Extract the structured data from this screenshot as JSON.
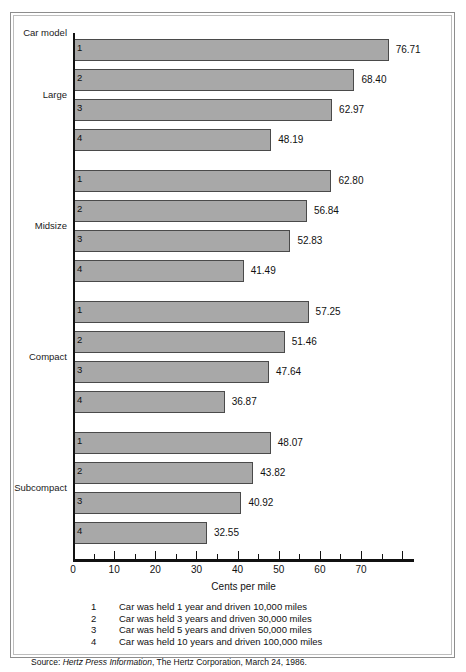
{
  "figure": {
    "header_label": "Car model",
    "axis_title": "Cents per mile",
    "source_prefix": "Source:",
    "source_italic": "Hertz Press Information",
    "source_rest": ", The Hertz Corporation, March 24, 1986.",
    "bar_color": "#a8a8a8",
    "bar_border_color": "#4a4a4a",
    "axis_color": "#111111",
    "frame_color": "#8d8d8d"
  },
  "legend": [
    {
      "key": "1",
      "text": "Car was held 1 year and driven 10,000 miles"
    },
    {
      "key": "2",
      "text": "Car was held 3 years and driven 30,000 miles"
    },
    {
      "key": "3",
      "text": "Car was held 5 years and driven 50,000 miles"
    },
    {
      "key": "4",
      "text": "Car was held 10 years and driven 100,000 miles"
    }
  ],
  "chart_data": {
    "type": "bar",
    "orientation": "horizontal",
    "title": "",
    "xlabel": "Cents per mile",
    "ylabel": "Car model",
    "xlim": [
      0,
      80
    ],
    "xticks": [
      0,
      10,
      20,
      30,
      40,
      50,
      60,
      70
    ],
    "xtick_labels": [
      "0",
      "10",
      "20",
      "30",
      "40",
      "50",
      "60",
      "70"
    ],
    "minor_tick_step": 5,
    "grid": false,
    "legend_position": "below-axis",
    "groups": [
      {
        "label": "Large",
        "bars": [
          {
            "model": "1",
            "value": 76.71,
            "value_label": "76.71"
          },
          {
            "model": "2",
            "value": 68.4,
            "value_label": "68.40"
          },
          {
            "model": "3",
            "value": 62.97,
            "value_label": "62.97"
          },
          {
            "model": "4",
            "value": 48.19,
            "value_label": "48.19"
          }
        ]
      },
      {
        "label": "Midsize",
        "bars": [
          {
            "model": "1",
            "value": 62.8,
            "value_label": "62.80"
          },
          {
            "model": "2",
            "value": 56.84,
            "value_label": "56.84"
          },
          {
            "model": "3",
            "value": 52.83,
            "value_label": "52.83"
          },
          {
            "model": "4",
            "value": 41.49,
            "value_label": "41.49"
          }
        ]
      },
      {
        "label": "Compact",
        "bars": [
          {
            "model": "1",
            "value": 57.25,
            "value_label": "57.25"
          },
          {
            "model": "2",
            "value": 51.46,
            "value_label": "51.46"
          },
          {
            "model": "3",
            "value": 47.64,
            "value_label": "47.64"
          },
          {
            "model": "4",
            "value": 36.87,
            "value_label": "36.87"
          }
        ]
      },
      {
        "label": "Subcompact",
        "bars": [
          {
            "model": "1",
            "value": 48.07,
            "value_label": "48.07"
          },
          {
            "model": "2",
            "value": 43.82,
            "value_label": "43.82"
          },
          {
            "model": "3",
            "value": 40.92,
            "value_label": "40.92"
          },
          {
            "model": "4",
            "value": 32.55,
            "value_label": "32.55"
          }
        ]
      }
    ]
  }
}
